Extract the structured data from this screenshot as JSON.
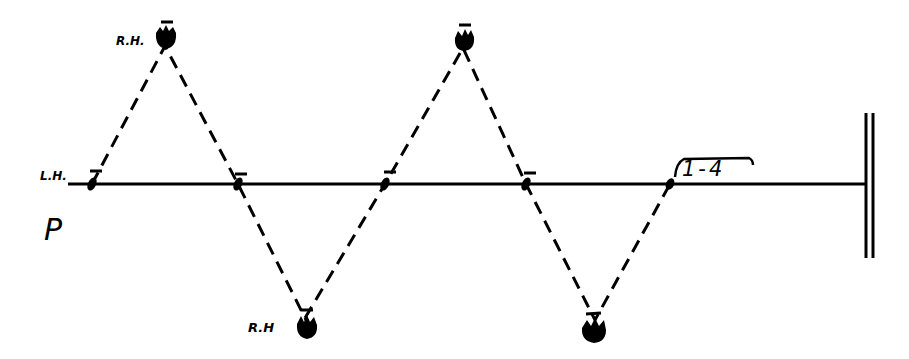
{
  "diagram": {
    "type": "footwork-pattern",
    "labels": {
      "left_hand": "L.H.",
      "pattern_letter": "P",
      "right_hand_top": "R.H.",
      "right_hand_bottom": "R.H",
      "count": "1-4"
    },
    "line": {
      "y": 184,
      "x_start": 68,
      "x_end": 866
    },
    "wall": {
      "x1": 866,
      "x2": 872,
      "y_top": 113,
      "y_bottom": 258
    },
    "left_hand_points": [
      {
        "x": 92,
        "y": 184
      },
      {
        "x": 238,
        "y": 184
      },
      {
        "x": 385,
        "y": 184
      },
      {
        "x": 526,
        "y": 184
      },
      {
        "x": 670,
        "y": 184
      }
    ],
    "right_hand_feet": [
      {
        "x": 165,
        "y": 38,
        "position": "top"
      },
      {
        "x": 305,
        "y": 325,
        "position": "bottom"
      },
      {
        "x": 463,
        "y": 40,
        "position": "top"
      },
      {
        "x": 595,
        "y": 328,
        "position": "bottom"
      }
    ],
    "colors": {
      "ink": "#000000",
      "paper": "#ffffff"
    }
  }
}
